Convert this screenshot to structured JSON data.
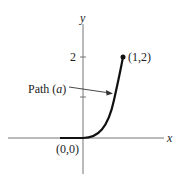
{
  "diagram": {
    "axes": {
      "x_label": "x",
      "y_label": "y",
      "y_tick_labels": [
        "2"
      ],
      "y_ticks": [
        1,
        2
      ]
    },
    "points": [
      {
        "label": "(0,0)",
        "x": 0,
        "y": 0
      },
      {
        "label": "(1,2)",
        "x": 1,
        "y": 2
      }
    ],
    "path_label": {
      "prefix": "Path (",
      "letter": "a",
      "suffix": ")"
    },
    "colors": {
      "ink": "#222222",
      "axis": "#555555",
      "background": "#ffffff"
    }
  }
}
